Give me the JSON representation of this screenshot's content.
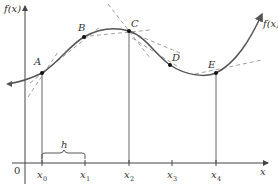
{
  "diagram": {
    "y_axis_label": "f(x)",
    "x_axis_label": "x",
    "origin_label": "0",
    "curve_label": "f(x)",
    "interval_label": "h",
    "points": [
      {
        "name": "A",
        "label": "A"
      },
      {
        "name": "B",
        "label": "B"
      },
      {
        "name": "C",
        "label": "C"
      },
      {
        "name": "D",
        "label": "D"
      },
      {
        "name": "E",
        "label": "E"
      }
    ],
    "ticks": [
      {
        "base": "x",
        "sub": "0"
      },
      {
        "base": "x",
        "sub": "1"
      },
      {
        "base": "x",
        "sub": "2"
      },
      {
        "base": "x",
        "sub": "3"
      },
      {
        "base": "x",
        "sub": "4"
      }
    ],
    "colors": {
      "curve": "#555555",
      "axes": "#444444",
      "tangent": "#888888",
      "points": "#111111"
    }
  }
}
